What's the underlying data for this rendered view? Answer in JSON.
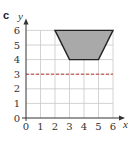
{
  "panel_label": "c",
  "chart_data": {
    "type": "diagram",
    "title": "",
    "xlabel": "x",
    "ylabel": "y",
    "xlim": [
      0,
      6
    ],
    "ylim": [
      0,
      6
    ],
    "x_ticks": [
      "0",
      "1",
      "2",
      "3",
      "4",
      "5",
      "6"
    ],
    "y_ticks": [
      "0",
      "1",
      "2",
      "3",
      "4",
      "5",
      "6"
    ],
    "grid": true,
    "shapes": [
      {
        "type": "polygon",
        "name": "trapezoid",
        "fill": "#a9a9a9",
        "vertices": [
          [
            2,
            6
          ],
          [
            6,
            6
          ],
          [
            5,
            4
          ],
          [
            3,
            4
          ]
        ]
      }
    ],
    "lines": [
      {
        "type": "dashed",
        "orientation": "horizontal",
        "y": 3,
        "color": "#c0392b"
      }
    ]
  },
  "colors": {
    "grid": "#c8c8c8",
    "axis": "#333333",
    "shape_fill": "#a9a9a9",
    "shape_stroke": "#222222",
    "dashed_line": "#c0392b"
  }
}
